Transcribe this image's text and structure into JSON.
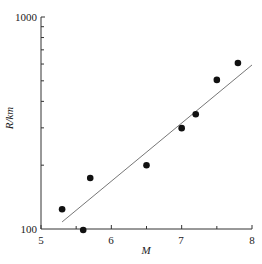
{
  "chart_data": {
    "type": "scatter",
    "title": "",
    "xlabel": "M",
    "ylabel": "R/km",
    "xlim": [
      5,
      8
    ],
    "ylim": [
      100,
      1000
    ],
    "yscale": "log",
    "x_ticks": [
      "5",
      "6",
      "7",
      "8"
    ],
    "y_ticks": [
      "100",
      "1000"
    ],
    "grid": false,
    "legend": null,
    "series": [
      {
        "name": "observations",
        "marker": "filled-circle",
        "points": [
          {
            "x": 5.3,
            "y": 124
          },
          {
            "x": 5.6,
            "y": 99
          },
          {
            "x": 5.7,
            "y": 174
          },
          {
            "x": 6.5,
            "y": 200
          },
          {
            "x": 7.0,
            "y": 299
          },
          {
            "x": 7.2,
            "y": 348
          },
          {
            "x": 7.5,
            "y": 505
          },
          {
            "x": 7.8,
            "y": 607
          }
        ]
      },
      {
        "name": "fit line",
        "type": "line",
        "points": [
          {
            "x": 5.3,
            "y": 108
          },
          {
            "x": 8.0,
            "y": 594
          }
        ]
      }
    ]
  },
  "axes": {
    "x_label": "M",
    "y_label": "R/km",
    "x_tick_labels": [
      "5",
      "6",
      "7",
      "8"
    ],
    "y_tick_labels": [
      "100",
      "1000"
    ]
  }
}
